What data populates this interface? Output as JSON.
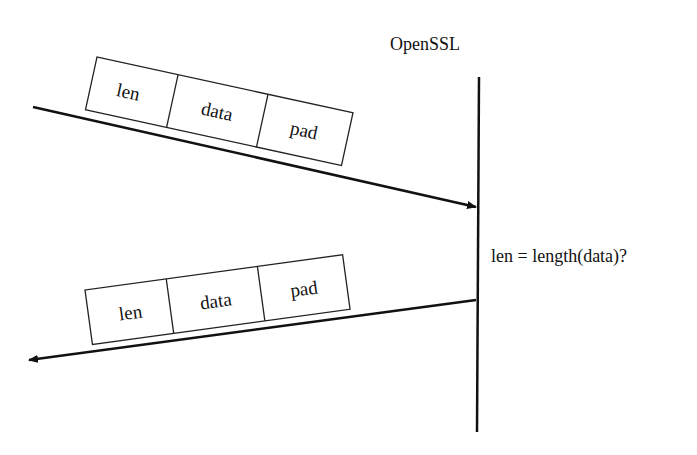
{
  "diagram": {
    "server_label": "OpenSSL",
    "check_label": "len = length(data)?",
    "request_packet": {
      "fields": [
        "len",
        "data",
        "pad"
      ],
      "direction": "to-server"
    },
    "response_packet": {
      "fields": [
        "len",
        "data",
        "pad"
      ],
      "direction": "to-client"
    },
    "colors": {
      "stroke": "#111111",
      "background": "#ffffff"
    }
  }
}
